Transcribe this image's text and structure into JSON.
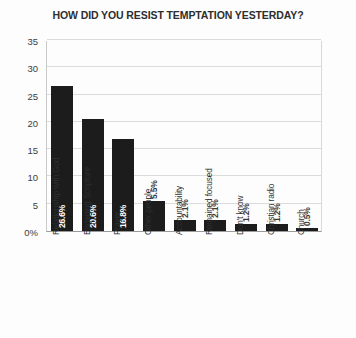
{
  "chart_data": {
    "type": "bar",
    "title": "HOW DID YOU RESIST TEMPTATION YESTERDAY?",
    "xlabel": "",
    "ylabel": "",
    "ylim": [
      0,
      35
    ],
    "grid": true,
    "legend": "none",
    "orientation": "vertical",
    "categories": [
      "Relationship with God",
      "Engaging Scripture",
      "Prayer",
      "Other people",
      "Accountability",
      "Remained focused",
      "Don't know",
      "Christian radio",
      "Church"
    ],
    "values": [
      26.6,
      20.6,
      16.8,
      5.5,
      2.1,
      2.1,
      1.2,
      1.2,
      0.5
    ],
    "value_labels": [
      "26.6%",
      "20.6%",
      "16.8%",
      "5.5%",
      "2.1%",
      "2.1%",
      "1.2%",
      "1.2%",
      "0.5%"
    ],
    "ytick_labels": [
      "0%",
      "5",
      "10",
      "15",
      "20",
      "25",
      "30",
      "35"
    ],
    "ytick_values": [
      0,
      5,
      10,
      15,
      20,
      25,
      30,
      35
    ],
    "bar_color": "#1c1c1c",
    "grid_color": "#dcdcdc",
    "axis_color": "#9a9a9a",
    "background_color": "#fdfdfd",
    "title_color": "#2e2e2e"
  }
}
